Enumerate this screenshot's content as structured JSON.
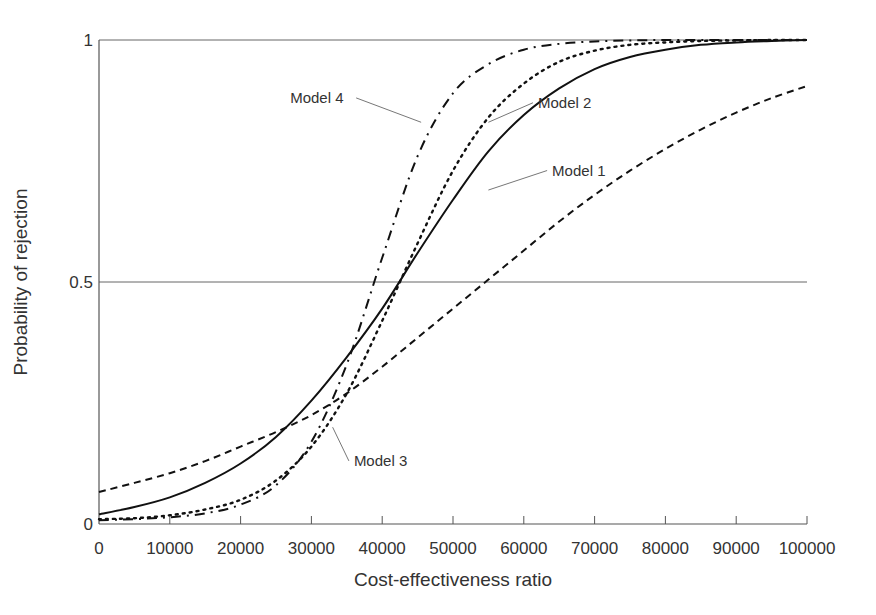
{
  "chart_data": {
    "type": "line",
    "title": "",
    "xlabel": "Cost-effectiveness ratio",
    "ylabel": "Probability of rejection",
    "xlim": [
      0,
      100000
    ],
    "ylim": [
      0,
      1
    ],
    "xticks": [
      0,
      10000,
      20000,
      30000,
      40000,
      50000,
      60000,
      70000,
      80000,
      90000,
      100000
    ],
    "xtick_labels": [
      "0",
      "10000",
      "20000",
      "30000",
      "40000",
      "50000",
      "60000",
      "70000",
      "80000",
      "90000",
      "100000"
    ],
    "yticks": [
      0,
      0.5,
      1
    ],
    "ytick_labels": [
      "0",
      "0.5",
      "1"
    ],
    "reference_lines": [
      0.5,
      1
    ],
    "grid": false,
    "legend": "none (inline annotations)",
    "x": [
      0,
      5000,
      10000,
      15000,
      20000,
      25000,
      30000,
      35000,
      40000,
      45000,
      50000,
      55000,
      60000,
      65000,
      70000,
      75000,
      80000,
      85000,
      90000,
      95000,
      100000
    ],
    "series": [
      {
        "name": "Model 1",
        "style": "dashed",
        "values": [
          0.066,
          0.085,
          0.105,
          0.13,
          0.16,
          0.19,
          0.225,
          0.27,
          0.325,
          0.385,
          0.445,
          0.505,
          0.565,
          0.625,
          0.68,
          0.73,
          0.775,
          0.815,
          0.85,
          0.88,
          0.905
        ]
      },
      {
        "name": "Model 2",
        "style": "solid",
        "values": [
          0.02,
          0.035,
          0.055,
          0.085,
          0.125,
          0.18,
          0.255,
          0.345,
          0.445,
          0.56,
          0.67,
          0.77,
          0.845,
          0.9,
          0.94,
          0.965,
          0.98,
          0.99,
          0.995,
          0.998,
          1.0
        ]
      },
      {
        "name": "Model 3",
        "style": "dotted",
        "values": [
          0.01,
          0.012,
          0.018,
          0.03,
          0.05,
          0.09,
          0.16,
          0.27,
          0.42,
          0.58,
          0.73,
          0.84,
          0.91,
          0.955,
          0.978,
          0.99,
          0.995,
          0.998,
          0.999,
          1.0,
          1.0
        ]
      },
      {
        "name": "Model 4",
        "style": "dash-dot",
        "values": [
          0.008,
          0.01,
          0.014,
          0.022,
          0.04,
          0.08,
          0.17,
          0.33,
          0.55,
          0.76,
          0.89,
          0.95,
          0.98,
          0.992,
          0.997,
          0.999,
          1.0,
          1.0,
          1.0,
          1.0,
          1.0
        ]
      }
    ],
    "annotations": [
      {
        "text": "Model 1",
        "x": 64000,
        "y": 0.72,
        "points_to": [
          55000,
          0.69
        ]
      },
      {
        "text": "Model 2",
        "x": 62000,
        "y": 0.86,
        "points_to": [
          55000,
          0.83
        ]
      },
      {
        "text": "Model 3",
        "x": 36000,
        "y": 0.12,
        "points_to": [
          33000,
          0.2
        ]
      },
      {
        "text": "Model 4",
        "x": 27000,
        "y": 0.87,
        "points_to": [
          45500,
          0.83
        ]
      }
    ]
  }
}
